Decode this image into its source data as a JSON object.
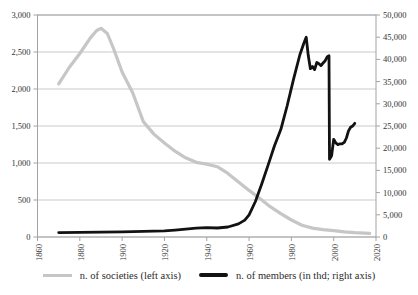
{
  "chart_data": {
    "type": "line",
    "title": "",
    "grid": "horizontal",
    "legend_position": "bottom-center",
    "colors": {
      "grid": "#c9c9c9",
      "border": "#a3a3a3",
      "tick": "#a3a3a3",
      "text": "#333333",
      "societies_line": "#c6c6c6",
      "members_line": "#121212"
    },
    "x_axis": {
      "min": 1860,
      "max": 2020,
      "ticks": [
        {
          "value": 1860,
          "label": "1860"
        },
        {
          "value": 1880,
          "label": "1880"
        },
        {
          "value": 1900,
          "label": "1900"
        },
        {
          "value": 1920,
          "label": "1920"
        },
        {
          "value": 1940,
          "label": "1940"
        },
        {
          "value": 1960,
          "label": "1960"
        },
        {
          "value": 1980,
          "label": "1980"
        },
        {
          "value": 2000,
          "label": "2000"
        },
        {
          "value": 2020,
          "label": "2020"
        }
      ]
    },
    "left_axis": {
      "min": 0,
      "max": 3000,
      "ticks": [
        {
          "value": 0,
          "label": "0"
        },
        {
          "value": 500,
          "label": "500"
        },
        {
          "value": 1000,
          "label": "1,000"
        },
        {
          "value": 1500,
          "label": "1,500"
        },
        {
          "value": 2000,
          "label": "2,000"
        },
        {
          "value": 2500,
          "label": "2,500"
        },
        {
          "value": 3000,
          "label": "3,000"
        }
      ]
    },
    "right_axis": {
      "min": 0,
      "max": 50000,
      "ticks": [
        {
          "value": 0,
          "label": "0"
        },
        {
          "value": 5000,
          "label": "5,000"
        },
        {
          "value": 10000,
          "label": "10,000"
        },
        {
          "value": 15000,
          "label": "15,000"
        },
        {
          "value": 20000,
          "label": "20,000"
        },
        {
          "value": 25000,
          "label": "25,000"
        },
        {
          "value": 30000,
          "label": "30,000"
        },
        {
          "value": 35000,
          "label": "35,000"
        },
        {
          "value": 40000,
          "label": "40,000"
        },
        {
          "value": 45000,
          "label": "45,000"
        },
        {
          "value": 50000,
          "label": "50,000"
        }
      ]
    },
    "series": [
      {
        "name": "n. of societies (left axis)",
        "axis": "left",
        "color": "#c6c6c6",
        "stroke_width": 3.2,
        "points": [
          [
            1870,
            2070
          ],
          [
            1875,
            2290
          ],
          [
            1880,
            2480
          ],
          [
            1885,
            2690
          ],
          [
            1888,
            2790
          ],
          [
            1890,
            2820
          ],
          [
            1893,
            2750
          ],
          [
            1896,
            2540
          ],
          [
            1900,
            2230
          ],
          [
            1905,
            1950
          ],
          [
            1910,
            1560
          ],
          [
            1915,
            1390
          ],
          [
            1920,
            1270
          ],
          [
            1925,
            1160
          ],
          [
            1930,
            1070
          ],
          [
            1935,
            1010
          ],
          [
            1940,
            985
          ],
          [
            1945,
            950
          ],
          [
            1950,
            860
          ],
          [
            1955,
            745
          ],
          [
            1960,
            630
          ],
          [
            1965,
            525
          ],
          [
            1970,
            410
          ],
          [
            1975,
            315
          ],
          [
            1980,
            230
          ],
          [
            1985,
            160
          ],
          [
            1990,
            120
          ],
          [
            1995,
            100
          ],
          [
            2000,
            85
          ],
          [
            2005,
            70
          ],
          [
            2010,
            60
          ],
          [
            2017,
            50
          ]
        ]
      },
      {
        "name": "n. of members (in thd; right axis)",
        "axis": "right",
        "color": "#121212",
        "stroke_width": 2.8,
        "points": [
          [
            1870,
            1000
          ],
          [
            1880,
            1030
          ],
          [
            1890,
            1080
          ],
          [
            1900,
            1150
          ],
          [
            1910,
            1250
          ],
          [
            1920,
            1400
          ],
          [
            1925,
            1550
          ],
          [
            1930,
            1750
          ],
          [
            1935,
            1980
          ],
          [
            1940,
            2120
          ],
          [
            1945,
            2020
          ],
          [
            1950,
            2250
          ],
          [
            1955,
            2950
          ],
          [
            1958,
            3800
          ],
          [
            1960,
            5000
          ],
          [
            1963,
            8000
          ],
          [
            1966,
            12000
          ],
          [
            1969,
            16200
          ],
          [
            1972,
            20500
          ],
          [
            1975,
            24200
          ],
          [
            1978,
            29500
          ],
          [
            1981,
            35500
          ],
          [
            1984,
            41000
          ],
          [
            1986,
            43800
          ],
          [
            1987,
            45000
          ],
          [
            1988,
            40800
          ],
          [
            1989,
            37900
          ],
          [
            1990,
            38400
          ],
          [
            1991,
            37700
          ],
          [
            1992,
            39300
          ],
          [
            1993,
            39000
          ],
          [
            1994,
            38600
          ],
          [
            1995,
            39200
          ],
          [
            1996,
            39700
          ],
          [
            1997,
            40600
          ],
          [
            1997.8,
            40800
          ],
          [
            1998,
            17500
          ],
          [
            1999,
            18300
          ],
          [
            2000,
            22000
          ],
          [
            2001,
            21200
          ],
          [
            2002,
            20800
          ],
          [
            2003,
            21000
          ],
          [
            2004,
            21000
          ],
          [
            2005,
            21300
          ],
          [
            2006,
            22300
          ],
          [
            2007,
            23900
          ],
          [
            2008,
            24700
          ],
          [
            2009,
            25000
          ],
          [
            2010,
            25600
          ]
        ]
      }
    ]
  }
}
